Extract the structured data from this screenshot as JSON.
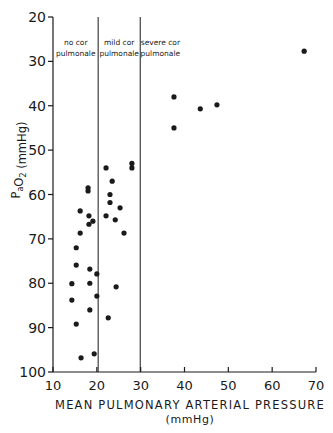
{
  "chart_data": {
    "type": "scatter",
    "title": "",
    "xlabel": "MEAN PULMONARY ARTERIAL PRESSURE",
    "xlabel_unit": "(mmHg)",
    "ylabel": "PaO2 (mmHg)",
    "xlim": [
      10,
      70
    ],
    "ylim": [
      20,
      100
    ],
    "y_inverted": true,
    "x_ticks": [
      10,
      20,
      30,
      40,
      50,
      60,
      70
    ],
    "y_ticks": [
      20,
      30,
      40,
      50,
      60,
      70,
      80,
      90,
      100
    ],
    "grid": false,
    "legend": null,
    "dividers": [
      {
        "x": 20.3
      },
      {
        "x": 29.9
      }
    ],
    "regions": [
      {
        "line1": "no cor",
        "line2": "pulmonale",
        "x_center": 15.2
      },
      {
        "line1": "mild cor",
        "line2": "pulmonale",
        "x_center": 25.1
      },
      {
        "line1": "severe cor",
        "line2": "pulmonale",
        "x_center": 34.5
      }
    ],
    "points": [
      {
        "x": 18.0,
        "y": 58.5
      },
      {
        "x": 18.0,
        "y": 59.2
      },
      {
        "x": 16.2,
        "y": 63.7
      },
      {
        "x": 18.2,
        "y": 64.8
      },
      {
        "x": 19.1,
        "y": 66.0
      },
      {
        "x": 18.2,
        "y": 66.7
      },
      {
        "x": 16.2,
        "y": 68.7
      },
      {
        "x": 15.3,
        "y": 72.0
      },
      {
        "x": 15.3,
        "y": 75.9
      },
      {
        "x": 18.4,
        "y": 76.8
      },
      {
        "x": 20.0,
        "y": 77.9
      },
      {
        "x": 14.3,
        "y": 80.1
      },
      {
        "x": 18.4,
        "y": 80.0
      },
      {
        "x": 20.0,
        "y": 82.9
      },
      {
        "x": 14.3,
        "y": 83.8
      },
      {
        "x": 18.4,
        "y": 86.0
      },
      {
        "x": 15.3,
        "y": 89.2
      },
      {
        "x": 19.4,
        "y": 95.9
      },
      {
        "x": 16.4,
        "y": 96.8
      },
      {
        "x": 22.1,
        "y": 54.0
      },
      {
        "x": 28.0,
        "y": 53.0
      },
      {
        "x": 28.0,
        "y": 54.0
      },
      {
        "x": 23.5,
        "y": 57.0
      },
      {
        "x": 23.0,
        "y": 60.0
      },
      {
        "x": 23.0,
        "y": 61.8
      },
      {
        "x": 25.3,
        "y": 63.0
      },
      {
        "x": 22.1,
        "y": 64.8
      },
      {
        "x": 24.2,
        "y": 65.7
      },
      {
        "x": 26.2,
        "y": 68.7
      },
      {
        "x": 24.4,
        "y": 80.8
      },
      {
        "x": 22.6,
        "y": 87.8
      },
      {
        "x": 37.6,
        "y": 38.0
      },
      {
        "x": 37.6,
        "y": 45.0
      },
      {
        "x": 43.6,
        "y": 40.7
      },
      {
        "x": 47.4,
        "y": 39.8
      },
      {
        "x": 67.3,
        "y": 27.7
      }
    ]
  },
  "colors": {
    "ink": "#1a1a1a",
    "background": "#ffffff"
  }
}
